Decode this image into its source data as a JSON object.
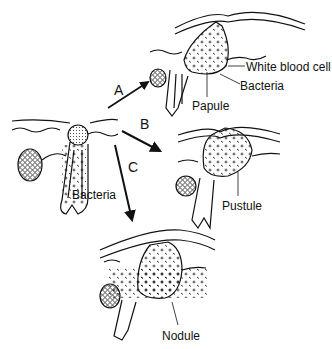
{
  "diagram": {
    "type": "acne lesion progression",
    "nodes": [
      {
        "id": "origin",
        "label": "Bacteria"
      },
      {
        "id": "papule",
        "labels": [
          "White blood cell",
          "Bacteria",
          "Papule"
        ]
      },
      {
        "id": "pustule",
        "labels": [
          "Pustule"
        ]
      },
      {
        "id": "nodule",
        "labels": [
          "Nodule"
        ]
      }
    ],
    "arrows": [
      {
        "label": "A",
        "from": "origin",
        "to": "papule"
      },
      {
        "label": "B",
        "from": "origin",
        "to": "pustule"
      },
      {
        "label": "C",
        "from": "origin",
        "to": "nodule"
      }
    ]
  },
  "labels": {
    "origin_bacteria": "Bacteria",
    "papule_wbc": "White blood cell",
    "papule_bacteria": "Bacteria",
    "papule": "Papule",
    "pustule": "Pustule",
    "nodule": "Nodule",
    "arrow_a": "A",
    "arrow_b": "B",
    "arrow_c": "C"
  }
}
